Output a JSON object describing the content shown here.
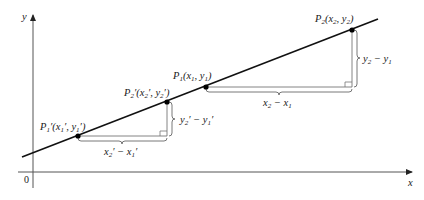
{
  "diagram": {
    "type": "coordinate-geometry",
    "axes": {
      "x_label": "x",
      "y_label": "y",
      "origin_label": "0"
    },
    "line": {
      "description": "straight line through points"
    },
    "points": [
      {
        "id": "P1prime",
        "label": "P1'(x1', y1')"
      },
      {
        "id": "P2prime",
        "label": "P2'(x2', y2')"
      },
      {
        "id": "P1",
        "label": "P1(x1, y1)"
      },
      {
        "id": "P2",
        "label": "P2(x2, y2)"
      }
    ],
    "brackets": [
      {
        "id": "run-prime",
        "label": "x2' − x1'"
      },
      {
        "id": "rise-prime",
        "label": "y2' − y1'"
      },
      {
        "id": "run",
        "label": "x2 − x1"
      },
      {
        "id": "rise",
        "label": "y2 − y1"
      }
    ],
    "colors": {
      "line": "#111111",
      "axis": "#555555",
      "triangle": "#666666"
    }
  }
}
